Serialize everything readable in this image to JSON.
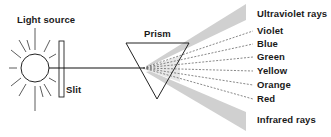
{
  "diagram": {
    "labels": {
      "light_source": "Light source",
      "slit": "Slit",
      "prism": "Prism"
    },
    "spectrum": [
      {
        "label": "Ultraviolet rays",
        "y": 14,
        "kind": "band"
      },
      {
        "label": "Violet",
        "y": 31,
        "kind": "ray"
      },
      {
        "label": "Blue",
        "y": 44,
        "kind": "ray"
      },
      {
        "label": "Green",
        "y": 57,
        "kind": "ray"
      },
      {
        "label": "Yellow",
        "y": 71,
        "kind": "ray"
      },
      {
        "label": "Orange",
        "y": 85,
        "kind": "ray"
      },
      {
        "label": "Red",
        "y": 99,
        "kind": "ray"
      },
      {
        "label": "Infrared rays",
        "y": 120,
        "kind": "band"
      }
    ],
    "colors": {
      "line": "#222222",
      "band": "#cfcfcf",
      "background": "#ffffff"
    }
  }
}
